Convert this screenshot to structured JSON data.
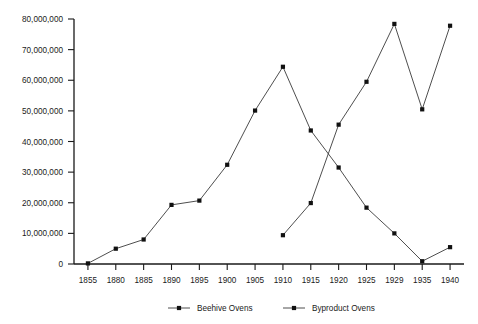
{
  "chart_data": {
    "type": "line",
    "title": "",
    "xlabel": "",
    "ylabel": "",
    "categories": [
      "1855",
      "1880",
      "1885",
      "1890",
      "1895",
      "1900",
      "1905",
      "1910",
      "1915",
      "1920",
      "1925",
      "1929",
      "1935",
      "1940"
    ],
    "ylim": [
      0,
      80000000
    ],
    "ytick_values": [
      0,
      10000000,
      20000000,
      30000000,
      40000000,
      50000000,
      60000000,
      70000000,
      80000000
    ],
    "ytick_labels": [
      "0",
      "10,000,000",
      "20,000,000",
      "30,000,000",
      "40,000,000",
      "50,000,000",
      "60,000,000",
      "70,000,000",
      "80,000,000"
    ],
    "grid": false,
    "legend_position": "bottom",
    "series": [
      {
        "name": "Beehive Ovens",
        "marker": "square",
        "color": "#3a3a3a",
        "values": [
          200000,
          5000000,
          8000000,
          19300000,
          20700000,
          32400000,
          50100000,
          64400000,
          43600000,
          31500000,
          18400000,
          10000000,
          900000,
          5500000
        ]
      },
      {
        "name": "Byproduct Ovens",
        "marker": "square",
        "color": "#3a3a3a",
        "values": [
          null,
          null,
          null,
          null,
          null,
          null,
          null,
          9400000,
          19900000,
          45500000,
          59500000,
          78400000,
          50500000,
          77800000
        ]
      }
    ]
  },
  "legend": {
    "items": [
      {
        "label": "Beehive Ovens"
      },
      {
        "label": "Byproduct Ovens"
      }
    ]
  }
}
